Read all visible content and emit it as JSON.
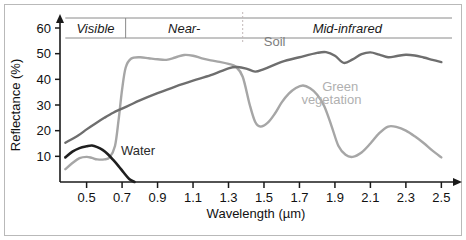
{
  "chart_data": {
    "type": "line",
    "title": "",
    "xlabel": "Wavelength (µm)",
    "ylabel": "Reflectance (%)",
    "xlim": [
      0.35,
      2.56
    ],
    "ylim": [
      0,
      63
    ],
    "grid": false,
    "legend_position": "inline-annotations",
    "xticks": [
      "0.5",
      "0.7",
      "0.9",
      "1.1",
      "1.3",
      "1.5",
      "1.7",
      "1.9",
      "2.1",
      "2.3",
      "2.5"
    ],
    "xtick_values": [
      0.5,
      0.7,
      0.9,
      1.1,
      1.3,
      1.5,
      1.7,
      1.9,
      2.1,
      2.3,
      2.5
    ],
    "yticks": [
      "10",
      "20",
      "30",
      "40",
      "50",
      "60"
    ],
    "ytick_values": [
      10,
      20,
      30,
      40,
      50,
      60
    ],
    "series": [
      {
        "name": "Soil",
        "color": "#6e6e6e",
        "x": [
          0.38,
          0.45,
          0.5,
          0.55,
          0.6,
          0.65,
          0.7,
          0.75,
          0.8,
          0.9,
          1.0,
          1.1,
          1.2,
          1.3,
          1.35,
          1.4,
          1.45,
          1.5,
          1.6,
          1.7,
          1.8,
          1.85,
          1.9,
          1.95,
          2.0,
          2.05,
          2.1,
          2.15,
          2.2,
          2.25,
          2.3,
          2.35,
          2.4,
          2.45,
          2.5
        ],
        "values": [
          15.3,
          18.0,
          20.5,
          22.8,
          25.0,
          27.0,
          28.6,
          30.2,
          31.8,
          34.6,
          37.2,
          39.5,
          41.6,
          44.3,
          44.8,
          44.2,
          43.0,
          44.0,
          46.8,
          48.6,
          50.3,
          50.6,
          49.2,
          46.4,
          47.8,
          49.8,
          50.5,
          49.6,
          48.6,
          49.1,
          49.6,
          49.3,
          48.5,
          47.6,
          46.7
        ]
      },
      {
        "name": "Green vegetation",
        "color": "#a6a6a6",
        "x": [
          0.38,
          0.42,
          0.46,
          0.5,
          0.53,
          0.56,
          0.6,
          0.63,
          0.66,
          0.68,
          0.7,
          0.72,
          0.75,
          0.8,
          0.85,
          0.9,
          0.95,
          1.0,
          1.05,
          1.1,
          1.15,
          1.2,
          1.25,
          1.3,
          1.34,
          1.38,
          1.42,
          1.45,
          1.48,
          1.52,
          1.56,
          1.6,
          1.64,
          1.68,
          1.72,
          1.76,
          1.8,
          1.84,
          1.88,
          1.92,
          1.96,
          2.0,
          2.05,
          2.1,
          2.15,
          2.2,
          2.25,
          2.3,
          2.35,
          2.4,
          2.45,
          2.5
        ],
        "values": [
          5.0,
          7.4,
          9.3,
          9.8,
          9.4,
          8.8,
          8.8,
          9.6,
          14.0,
          24.0,
          36.0,
          44.5,
          48.0,
          48.6,
          48.2,
          47.8,
          47.6,
          48.5,
          49.5,
          49.2,
          48.2,
          47.4,
          46.8,
          46.0,
          45.0,
          41.0,
          30.0,
          23.5,
          21.6,
          23.0,
          26.5,
          31.0,
          34.4,
          36.6,
          37.6,
          36.5,
          34.0,
          29.5,
          22.0,
          14.0,
          10.6,
          9.8,
          11.5,
          15.0,
          19.0,
          21.6,
          21.4,
          20.0,
          17.8,
          15.2,
          12.2,
          9.6
        ]
      },
      {
        "name": "Water",
        "color": "#1f1f1f",
        "x": [
          0.38,
          0.42,
          0.46,
          0.5,
          0.53,
          0.56,
          0.59,
          0.62,
          0.65,
          0.68,
          0.71,
          0.74,
          0.77
        ],
        "values": [
          9.6,
          11.8,
          13.2,
          13.9,
          14.2,
          13.6,
          12.5,
          10.8,
          8.6,
          6.2,
          3.6,
          1.2,
          0.0
        ]
      }
    ],
    "bands": [
      {
        "label": "Visible",
        "start": 0.38,
        "end": 0.72
      },
      {
        "label": "Near-",
        "start": 0.72,
        "end": 1.38
      },
      {
        "label": "Mid-infrared",
        "start": 1.38,
        "end": 2.56
      }
    ],
    "annotations": [
      {
        "text": "Soil",
        "x": 1.56,
        "y": 53.0,
        "color": "#7d7d7d"
      },
      {
        "text": "Green",
        "x": 1.93,
        "y": 35.5,
        "color": "#b0b0b0"
      },
      {
        "text": "vegetation",
        "x": 1.88,
        "y": 30.5,
        "color": "#b0b0b0"
      },
      {
        "text": "Water",
        "x": 0.79,
        "y": 10.5,
        "color": "#2b2b2b"
      }
    ]
  },
  "colors": {
    "soil": "#6e6e6e",
    "vegetation": "#a6a6a6",
    "water": "#1f1f1f",
    "axis": "#1a1a1a",
    "band_rule": "#8a8a8a",
    "frame": "#b9b9b9",
    "background": "#ffffff"
  }
}
